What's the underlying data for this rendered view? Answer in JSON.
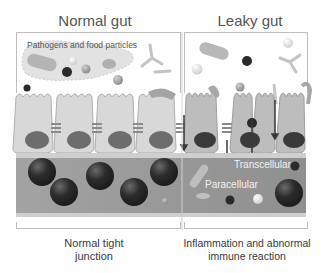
{
  "panels": {
    "left": {
      "title": "Normal gut",
      "annotation": "Pathogens and  food particles",
      "caption_line1": "Normal tight",
      "caption_line2": "junction"
    },
    "right": {
      "title": "Leaky gut",
      "label_transcellular": "Transcellular",
      "label_paracellular": "Paracellular",
      "caption_line1": "Inflammation and abnormal",
      "caption_line2": "immune reaction"
    }
  },
  "colors": {
    "cell_fill": "#d6d6d6",
    "cell_fill_leaky": "#b9b9b9",
    "nucleus": "#5a5a5a",
    "nucleus_leaky": "#3a3a3a",
    "lamina": "#9c9c9c",
    "immune_cell": "#2e2e2e",
    "frame": "#bdbdbd"
  }
}
